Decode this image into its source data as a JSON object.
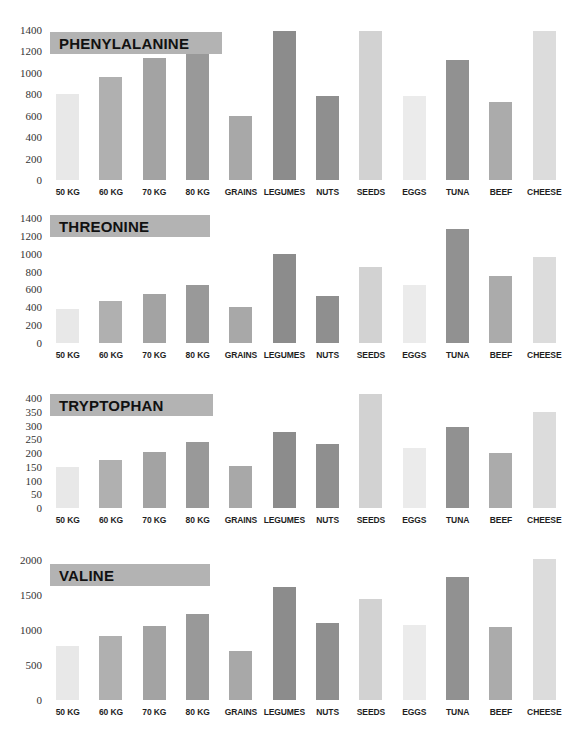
{
  "page": {
    "background": "#ffffff",
    "banner_color": "#b3b3b3"
  },
  "categories": [
    "50 KG",
    "60 KG",
    "70 KG",
    "80 KG",
    "GRAINS",
    "LEGUMES",
    "NUTS",
    "SEEDS",
    "EGGS",
    "TUNA",
    "BEEF",
    "CHEESE"
  ],
  "bar_colors": [
    "#e8e8e8",
    "#b0b0b0",
    "#a3a3a3",
    "#999999",
    "#a8a8a8",
    "#8c8c8c",
    "#8f8f8f",
    "#d2d2d2",
    "#ebebeb",
    "#919191",
    "#ababab",
    "#dcdcdc"
  ],
  "chart_data": [
    {
      "type": "bar",
      "title": "PHENYLALANINE",
      "xlabel": "",
      "ylabel": "",
      "categories": [
        "50 KG",
        "60 KG",
        "70 KG",
        "80 KG",
        "GRAINS",
        "LEGUMES",
        "NUTS",
        "SEEDS",
        "EGGS",
        "TUNA",
        "BEEF",
        "CHEESE"
      ],
      "values": [
        800,
        960,
        1140,
        1320,
        600,
        1395,
        785,
        1395,
        780,
        1120,
        725,
        1390
      ],
      "ylim": [
        0,
        1400
      ],
      "yticks": [
        0,
        200,
        400,
        600,
        800,
        1000,
        1200,
        1400
      ],
      "grid": false,
      "legend": "none"
    },
    {
      "type": "bar",
      "title": "THREONINE",
      "xlabel": "",
      "ylabel": "",
      "categories": [
        "50 KG",
        "60 KG",
        "70 KG",
        "80 KG",
        "GRAINS",
        "LEGUMES",
        "NUTS",
        "SEEDS",
        "EGGS",
        "TUNA",
        "BEEF",
        "CHEESE"
      ],
      "values": [
        385,
        465,
        545,
        645,
        405,
        995,
        525,
        850,
        650,
        1275,
        755,
        960
      ],
      "ylim": [
        0,
        1400
      ],
      "yticks": [
        0,
        200,
        400,
        600,
        800,
        1000,
        1200,
        1400
      ],
      "grid": false,
      "legend": "none"
    },
    {
      "type": "bar",
      "title": "TRYPTOPHAN",
      "xlabel": "",
      "ylabel": "",
      "categories": [
        "50 KG",
        "60 KG",
        "70 KG",
        "80 KG",
        "GRAINS",
        "LEGUMES",
        "NUTS",
        "SEEDS",
        "EGGS",
        "TUNA",
        "BEEF",
        "CHEESE"
      ],
      "values": [
        148,
        175,
        205,
        240,
        152,
        275,
        232,
        415,
        220,
        295,
        200,
        350
      ],
      "ylim": [
        0,
        400
      ],
      "yticks": [
        0,
        50,
        100,
        150,
        200,
        250,
        300,
        350,
        400
      ],
      "grid": false,
      "legend": "none"
    },
    {
      "type": "bar",
      "title": "VALINE",
      "xlabel": "",
      "ylabel": "",
      "categories": [
        "50 KG",
        "60 KG",
        "70 KG",
        "80 KG",
        "GRAINS",
        "LEGUMES",
        "NUTS",
        "SEEDS",
        "EGGS",
        "TUNA",
        "BEEF",
        "CHEESE"
      ],
      "values": [
        770,
        915,
        1060,
        1230,
        700,
        1610,
        1100,
        1450,
        1075,
        1760,
        1040,
        2010
      ],
      "ylim": [
        0,
        2000
      ],
      "yticks": [
        0,
        500,
        1000,
        1500,
        2000
      ],
      "grid": false,
      "legend": "none"
    }
  ]
}
